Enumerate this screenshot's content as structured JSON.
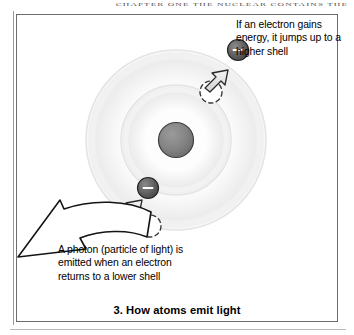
{
  "page": {
    "running_header": "CHAPTER ONE   THE NUCLEAR CONTAINS THE",
    "background_color": "#ffffff"
  },
  "figure": {
    "caption": "3. How atoms emit light",
    "frame": {
      "x": 16,
      "y": 14,
      "width": 322,
      "height": 308,
      "border_color": "#6d6d6d"
    },
    "callouts": [
      {
        "id": "absorb",
        "text": "If an electron gains energy, it jumps up to a higher shell",
        "lines": [
          "If an electron gains",
          "energy, it jumps up",
          "to a higher shell"
        ],
        "x": 236,
        "y": 18
      },
      {
        "id": "emit",
        "text": "A photon (particle of light) is emitted when an electron returns to a lower shell",
        "lines": [
          "A photon (particle of",
          "light) is emitted when",
          "an electron returns to",
          "a lower shell"
        ],
        "x": 58,
        "y": 243
      }
    ]
  },
  "diagram": {
    "type": "atom-energy-level-diagram",
    "center": {
      "x": 176,
      "y": 140
    },
    "nucleus": {
      "cx": 176,
      "cy": 140,
      "r": 17,
      "fill": "#7d7d7d",
      "stroke": "#3c3c3c",
      "label": "nucleus"
    },
    "shells": [
      {
        "name": "inner-shell",
        "cx": 176,
        "cy": 140,
        "r": 55,
        "fill": "#f2f2f2",
        "stroke": "#e2e2e2"
      },
      {
        "name": "outer-shell",
        "cx": 176,
        "cy": 140,
        "r": 90,
        "fill": "#f4f4f4",
        "stroke": "#e6e6e6"
      }
    ],
    "electrons": [
      {
        "name": "electron-upper-outer",
        "cx": 238,
        "cy": 50,
        "r": 10.5,
        "fill": "#5e5e5e",
        "stroke": "#2b2b2b",
        "charge": "–"
      },
      {
        "name": "electron-lower-inner",
        "cx": 148,
        "cy": 188,
        "r": 10.5,
        "fill": "#5e5e5e",
        "stroke": "#2b2b2b",
        "charge": "–"
      }
    ],
    "ghost_positions": [
      {
        "name": "ghost-electron-upper",
        "cx": 211,
        "cy": 92,
        "r": 11,
        "stroke": "#3a3a3a"
      },
      {
        "name": "ghost-electron-lower",
        "cx": 150,
        "cy": 226,
        "r": 11,
        "stroke": "#3a3a3a"
      }
    ],
    "jump_arrows": [
      {
        "name": "jump-arrow-upper",
        "from": {
          "x": 214,
          "y": 80
        },
        "to": {
          "x": 231,
          "y": 58
        }
      },
      {
        "name": "jump-arrow-lower",
        "from": {
          "x": 126,
          "y": 215
        },
        "to": {
          "x": 142,
          "y": 196
        }
      }
    ],
    "photon_arrow": {
      "name": "photon-arrow",
      "from": {
        "x": 152,
        "y": 216
      },
      "to": {
        "x": 17,
        "y": 256
      },
      "fill": "#ffffff",
      "stroke": "#1a1a1a"
    },
    "colors": {
      "nucleus": "#7d7d7d",
      "electron": "#5e5e5e",
      "shell": "#f2f2f2",
      "outline": "#1a1a1a",
      "arrow_fill": "#e8e8e8"
    }
  }
}
